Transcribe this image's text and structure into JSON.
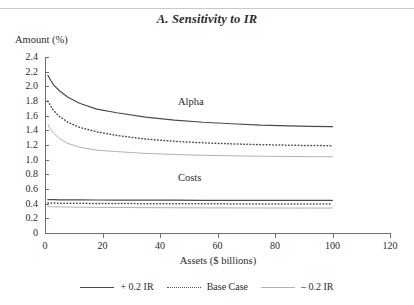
{
  "chart_data": {
    "type": "line",
    "title": "A. Sensitivity to IR",
    "xlabel": "Assets ($ billions)",
    "ylabel": "Amount (%)",
    "xlim": [
      0,
      120
    ],
    "ylim": [
      0,
      2.4
    ],
    "xticks": [
      "0",
      "20",
      "40",
      "60",
      "80",
      "100",
      "120"
    ],
    "yticks": [
      "0",
      "0.2",
      "0.4",
      "0.6",
      "0.8",
      "1.0",
      "1.2",
      "1.4",
      "1.6",
      "1.8",
      "2.0",
      "2.2",
      "2.4"
    ],
    "grid": false,
    "legend_position": "bottom",
    "annotations": [
      {
        "text": "Alpha",
        "x": 60,
        "y": 1.72
      },
      {
        "text": "Costs",
        "x": 60,
        "y": 0.76
      }
    ],
    "x": [
      1,
      2,
      3,
      5,
      8,
      12,
      18,
      25,
      35,
      45,
      55,
      65,
      75,
      85,
      92,
      100
    ],
    "series": [
      {
        "name": "+ 0.2 IR",
        "group": "Alpha",
        "style": "solid",
        "color": "#4a4a4a",
        "values": [
          2.15,
          2.08,
          2.02,
          1.94,
          1.85,
          1.77,
          1.69,
          1.64,
          1.58,
          1.54,
          1.51,
          1.49,
          1.47,
          1.46,
          1.455,
          1.45
        ]
      },
      {
        "name": "Base Case",
        "group": "Alpha",
        "style": "dotted",
        "color": "#4f4f4f",
        "values": [
          1.8,
          1.73,
          1.67,
          1.59,
          1.51,
          1.44,
          1.38,
          1.33,
          1.28,
          1.25,
          1.23,
          1.215,
          1.205,
          1.197,
          1.193,
          1.19
        ]
      },
      {
        "name": "- 0.2 IR",
        "group": "Alpha",
        "style": "solid-light",
        "color": "#b2b2b2",
        "values": [
          1.48,
          1.41,
          1.36,
          1.29,
          1.22,
          1.17,
          1.13,
          1.11,
          1.085,
          1.07,
          1.06,
          1.053,
          1.047,
          1.043,
          1.041,
          1.04
        ]
      },
      {
        "name": "+ 0.2 IR",
        "group": "Costs",
        "style": "solid",
        "color": "#4a4a4a",
        "values": [
          0.455,
          0.455,
          0.454,
          0.453,
          0.452,
          0.451,
          0.45,
          0.449,
          0.448,
          0.447,
          0.446,
          0.446,
          0.445,
          0.445,
          0.445,
          0.445
        ]
      },
      {
        "name": "Base Case",
        "group": "Costs",
        "style": "dotted",
        "color": "#4f4f4f",
        "values": [
          0.41,
          0.409,
          0.408,
          0.407,
          0.406,
          0.405,
          0.403,
          0.402,
          0.4,
          0.399,
          0.398,
          0.397,
          0.396,
          0.396,
          0.395,
          0.395
        ]
      },
      {
        "name": "- 0.2 IR",
        "group": "Costs",
        "style": "solid-light",
        "color": "#b2b2b2",
        "values": [
          0.36,
          0.358,
          0.357,
          0.356,
          0.354,
          0.352,
          0.35,
          0.348,
          0.346,
          0.344,
          0.343,
          0.342,
          0.341,
          0.34,
          0.34,
          0.34
        ]
      }
    ],
    "legend": [
      {
        "label": "+ 0.2 IR",
        "style": "solid-dark"
      },
      {
        "label": "Base Case",
        "style": "dotted"
      },
      {
        "label": "– 0.2 IR",
        "style": "solid-light"
      }
    ]
  }
}
